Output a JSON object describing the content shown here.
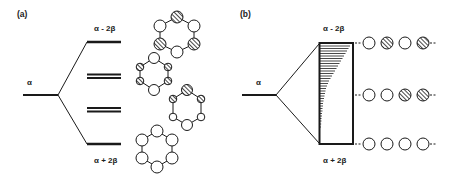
{
  "figure": {
    "panel_a": {
      "label": "(a)",
      "alpha_label": "α",
      "top_level_label": "α - 2β",
      "bottom_level_label": "α + 2β",
      "levels": [
        {
          "name": "antibonding-top",
          "degeneracy": 1
        },
        {
          "name": "antibonding-degenerate",
          "degeneracy": 2
        },
        {
          "name": "bonding-degenerate",
          "degeneracy": 2
        },
        {
          "name": "bonding-bottom",
          "degeneracy": 1
        }
      ],
      "orbital_rings": [
        {
          "name": "ring-top",
          "pattern": [
            "hatched",
            "open",
            "hatched",
            "open",
            "hatched",
            "open"
          ]
        },
        {
          "name": "ring-second",
          "pattern": [
            "open",
            "hatched",
            "hatched",
            "open",
            "hatched",
            "hatched"
          ]
        },
        {
          "name": "ring-third",
          "pattern": [
            "hatched",
            "hatched",
            "open",
            "open",
            "open",
            "hatched"
          ]
        },
        {
          "name": "ring-bottom",
          "pattern": [
            "open",
            "open",
            "open",
            "open",
            "open",
            "open"
          ]
        }
      ]
    },
    "panel_b": {
      "label": "(b)",
      "alpha_label": "α",
      "top_level_label": "α - 2β",
      "bottom_level_label": "α + 2β",
      "band_name": "energy-band",
      "orbital_chains": [
        {
          "name": "chain-top",
          "pattern": [
            "open",
            "hatched",
            "open",
            "hatched"
          ]
        },
        {
          "name": "chain-middle",
          "pattern": [
            "open",
            "open",
            "hatched",
            "hatched"
          ]
        },
        {
          "name": "chain-bottom",
          "pattern": [
            "open",
            "open",
            "open",
            "open"
          ]
        }
      ]
    },
    "colors": {
      "ink": "#1a1a1a",
      "background": "#ffffff"
    }
  }
}
